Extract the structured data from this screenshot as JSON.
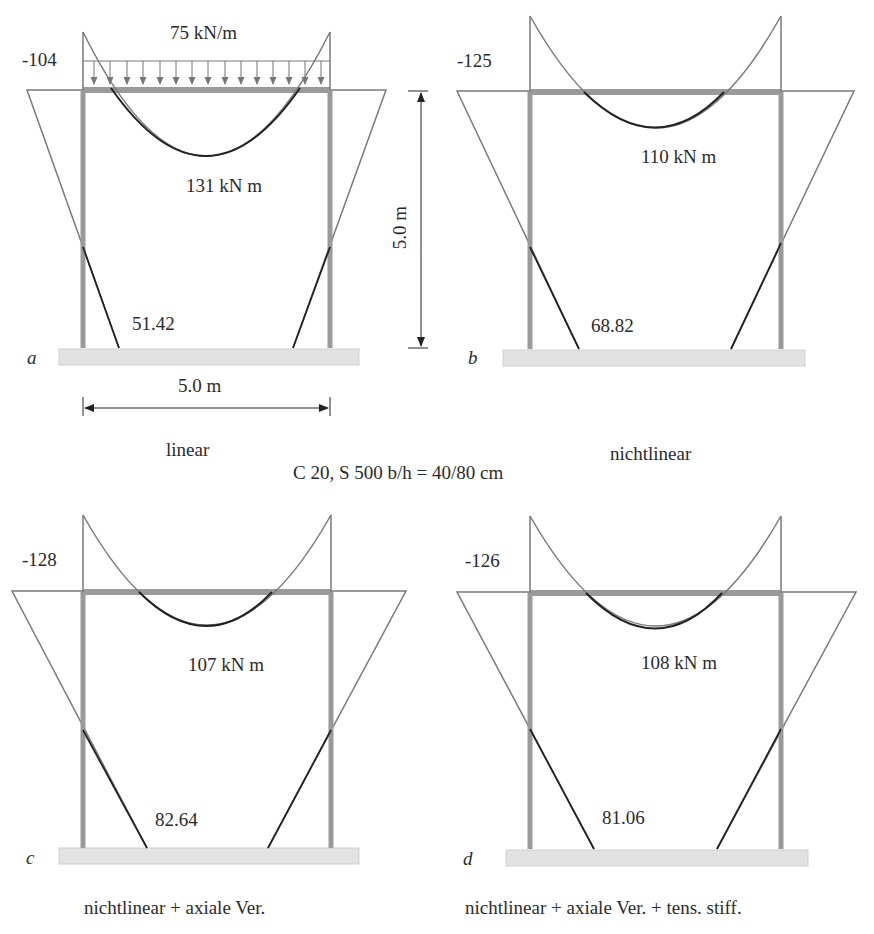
{
  "load": {
    "value": "75 kN/m"
  },
  "dimensions": {
    "height": "5.0 m",
    "width": "5.0 m"
  },
  "material": "C 20, S 500 b/h = 40/80 cm",
  "colors": {
    "frame": "#9a9a9a",
    "base": "#e2e2e2",
    "diagram": "#7a7a7a",
    "curve": "#222222"
  },
  "panels": [
    {
      "id": "a",
      "letter": "a",
      "caption": "linear",
      "support_moment": "-104",
      "field_moment": "131  kN m",
      "base_moment": "51.42"
    },
    {
      "id": "b",
      "letter": "b",
      "caption": "nichtlinear",
      "support_moment": "-125",
      "field_moment": "110 kN m",
      "base_moment": "68.82"
    },
    {
      "id": "c",
      "letter": "c",
      "caption": "nichtlinear + axiale Ver.",
      "support_moment": "-128",
      "field_moment": "107  kN m",
      "base_moment": "82.64"
    },
    {
      "id": "d",
      "letter": "d",
      "caption": "nichtlinear + axiale Ver. + tens. stiff.",
      "support_moment": "-126",
      "field_moment": "108  kN m",
      "base_moment": "81.06"
    }
  ]
}
